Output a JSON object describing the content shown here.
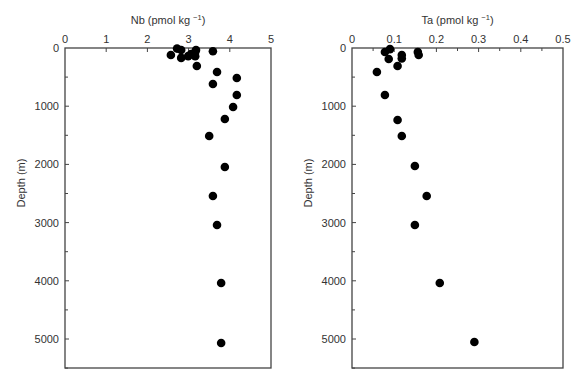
{
  "chart_data": [
    {
      "type": "scatter",
      "title": "",
      "xlabel": "Nb (pmol kg⁻¹)",
      "ylabel": "Depth (m)",
      "xlim": [
        0,
        5
      ],
      "ylim": [
        5550,
        0
      ],
      "x_ticks": [
        "0",
        "1",
        "2",
        "3",
        "4",
        "5"
      ],
      "y_ticks": [
        "0",
        "1000",
        "2000",
        "3000",
        "4000",
        "5000"
      ],
      "x_axis_position": "top",
      "grid": false,
      "legend": null,
      "series": [
        {
          "name": "Nb",
          "points": [
            {
              "x": 2.72,
              "y": 10
            },
            {
              "x": 2.82,
              "y": 35
            },
            {
              "x": 2.57,
              "y": 120
            },
            {
              "x": 2.82,
              "y": 170
            },
            {
              "x": 2.99,
              "y": 140
            },
            {
              "x": 3.06,
              "y": 105
            },
            {
              "x": 3.16,
              "y": 70
            },
            {
              "x": 3.18,
              "y": 35
            },
            {
              "x": 3.16,
              "y": 140
            },
            {
              "x": 3.2,
              "y": 309
            },
            {
              "x": 3.59,
              "y": 55
            },
            {
              "x": 3.69,
              "y": 412
            },
            {
              "x": 4.17,
              "y": 515
            },
            {
              "x": 3.59,
              "y": 619
            },
            {
              "x": 4.17,
              "y": 808
            },
            {
              "x": 4.08,
              "y": 1014
            },
            {
              "x": 3.88,
              "y": 1220
            },
            {
              "x": 3.5,
              "y": 1512
            },
            {
              "x": 3.88,
              "y": 2045
            },
            {
              "x": 3.59,
              "y": 2543
            },
            {
              "x": 3.69,
              "y": 3041
            },
            {
              "x": 3.79,
              "y": 4038
            },
            {
              "x": 3.79,
              "y": 5069
            }
          ]
        }
      ]
    },
    {
      "type": "scatter",
      "title": "",
      "xlabel": "Ta (pmol kg⁻¹)",
      "ylabel": "Depth (m)",
      "xlim": [
        0,
        0.5
      ],
      "ylim": [
        5550,
        0
      ],
      "x_ticks": [
        "0",
        "0.1",
        "0.2",
        "0.3",
        "0.4",
        "0.5"
      ],
      "y_ticks": [
        "0",
        "1000",
        "2000",
        "3000",
        "4000",
        "5000"
      ],
      "x_axis_position": "top",
      "grid": false,
      "legend": null,
      "series": [
        {
          "name": "Ta",
          "points": [
            {
              "x": 0.078,
              "y": 70
            },
            {
              "x": 0.09,
              "y": 20
            },
            {
              "x": 0.087,
              "y": 190
            },
            {
              "x": 0.118,
              "y": 120
            },
            {
              "x": 0.118,
              "y": 180
            },
            {
              "x": 0.108,
              "y": 309
            },
            {
              "x": 0.059,
              "y": 412
            },
            {
              "x": 0.156,
              "y": 70
            },
            {
              "x": 0.158,
              "y": 120
            },
            {
              "x": 0.078,
              "y": 808
            },
            {
              "x": 0.108,
              "y": 1237
            },
            {
              "x": 0.118,
              "y": 1512
            },
            {
              "x": 0.149,
              "y": 2027
            },
            {
              "x": 0.177,
              "y": 2543
            },
            {
              "x": 0.149,
              "y": 3041
            },
            {
              "x": 0.208,
              "y": 4038
            },
            {
              "x": 0.29,
              "y": 5052
            }
          ]
        }
      ]
    }
  ],
  "panels": {
    "left": {
      "xlabel_main": "Nb (pmol kg",
      "xlabel_sup": "−1",
      "xlabel_end": ")",
      "ylabel": "Depth (m)"
    },
    "right": {
      "xlabel_main": "Ta (pmol kg",
      "xlabel_sup": "−1",
      "xlabel_end": ")",
      "ylabel": "Depth (m)"
    }
  }
}
